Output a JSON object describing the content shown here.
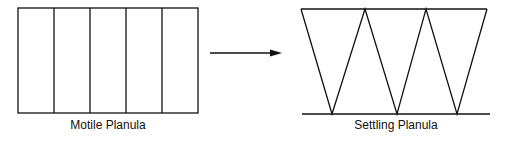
{
  "diagram": {
    "left": {
      "label": "Motile Planula",
      "cells": 5
    },
    "arrow": {
      "direction": "right"
    },
    "right": {
      "label": "Settling Planula",
      "cells": 5
    }
  },
  "colors": {
    "stroke": "#111111",
    "background": "#ffffff"
  }
}
